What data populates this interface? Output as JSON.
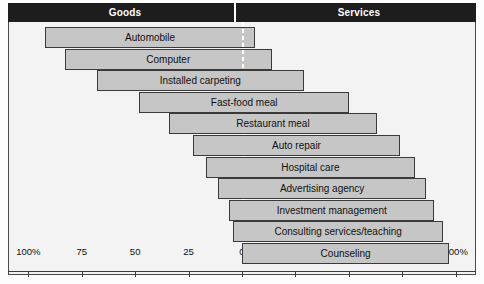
{
  "header": {
    "goods_label": "Goods",
    "services_label": "Services"
  },
  "colors": {
    "header_band": "#1d1d1d",
    "header_text": "#ffffff",
    "panel_background": "#f3f3f3",
    "bar_fill": "#c6c6c6",
    "bar_border": "#3a3a3a",
    "zero_line": "#ffffff",
    "axis": "#3a3a3a"
  },
  "chart_data": {
    "type": "bar",
    "title": "",
    "subtitle": "",
    "xlabel": "",
    "ylabel": "",
    "orientation": "horizontal",
    "legend": [
      "Goods",
      "Services"
    ],
    "legend_position": "top",
    "grid": false,
    "axis": {
      "zero_at": 0,
      "goods_ticks": [
        100,
        75,
        50,
        25
      ],
      "services_ticks": [
        0,
        25,
        50,
        75,
        100
      ],
      "tick_labels": [
        "100%",
        "75",
        "50",
        "25",
        "0",
        "25",
        "50",
        "75",
        "100%"
      ],
      "tick_values": [
        -100,
        -75,
        -50,
        -25,
        0,
        25,
        50,
        75,
        100
      ],
      "xlim": [
        -100,
        100
      ]
    },
    "categories": [
      "Automobile",
      "Computer",
      "Installed carpeting",
      "Fast-food meal",
      "Restaurant meal",
      "Auto repair",
      "Hospital care",
      "Advertising agency",
      "Investment management",
      "Consulting services/teaching",
      "Counseling"
    ],
    "series": [
      {
        "name": "Goods",
        "values": [
          92,
          83,
          68,
          48,
          34,
          23,
          17,
          11,
          6,
          4,
          0
        ]
      },
      {
        "name": "Services",
        "values": [
          6,
          14,
          29,
          50,
          63,
          74,
          81,
          86,
          90,
          94,
          97
        ]
      }
    ],
    "bars": [
      {
        "label": "Automobile",
        "goods": 92,
        "services": 6
      },
      {
        "label": "Computer",
        "goods": 83,
        "services": 14
      },
      {
        "label": "Installed carpeting",
        "goods": 68,
        "services": 29
      },
      {
        "label": "Fast-food meal",
        "goods": 48,
        "services": 50
      },
      {
        "label": "Restaurant meal",
        "goods": 34,
        "services": 63
      },
      {
        "label": "Auto repair",
        "goods": 23,
        "services": 74
      },
      {
        "label": "Hospital care",
        "goods": 17,
        "services": 81
      },
      {
        "label": "Advertising agency",
        "goods": 11,
        "services": 86
      },
      {
        "label": "Investment management",
        "goods": 6,
        "services": 90
      },
      {
        "label": "Consulting services/teaching",
        "goods": 4,
        "services": 94
      },
      {
        "label": "Counseling",
        "goods": 0,
        "services": 97
      }
    ]
  }
}
